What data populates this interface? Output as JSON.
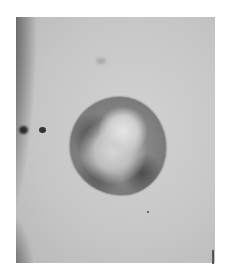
{
  "image": {
    "subject": "close-up photograph of a round skin lesion",
    "tone": "grayscale",
    "colors": {
      "skin": "#c8c8c8",
      "lesion_center": "#d8d8d8",
      "lesion_border": "#3c3c3c",
      "shadow": "#1a1a1a",
      "background": "#ffffff"
    }
  }
}
